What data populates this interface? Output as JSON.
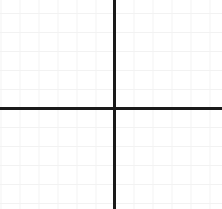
{
  "figure": {
    "name": "cartesian-coordinate-grid",
    "width": 222,
    "height": 209,
    "background_color": "#ffffff"
  },
  "chart_data": {
    "type": "scatter",
    "title": "",
    "subtitle": "",
    "xlabel": "",
    "ylabel": "",
    "grid": true,
    "grid_minor_spacing_px": 19,
    "legend": "none",
    "legend_entries": [],
    "annotations": [],
    "tick_labels_x": [],
    "tick_labels_y": [],
    "series": [],
    "x": [],
    "values": [],
    "xlim": [
      -6,
      5.7
    ],
    "ylim": [
      -5.3,
      5.7
    ],
    "origin_px": {
      "x": 114.5,
      "y": 108
    },
    "cells_left_of_origin": 6,
    "cells_right_of_origin": 5.7,
    "cells_above_origin": 5.7,
    "cells_below_origin": 5.3
  },
  "style": {
    "grid_color": "#f2f2f2",
    "axis_color": "#1a1a1a",
    "axis_weight_px": 3,
    "grid_step_px": 19,
    "grid_origin_offset_x_px": 0.5,
    "grid_origin_offset_y_px": 13
  },
  "axes": {
    "x_axis_name": "x-axis",
    "y_axis_name": "y-axis",
    "x_axis_top_px": 107,
    "y_axis_left_px": 113
  }
}
